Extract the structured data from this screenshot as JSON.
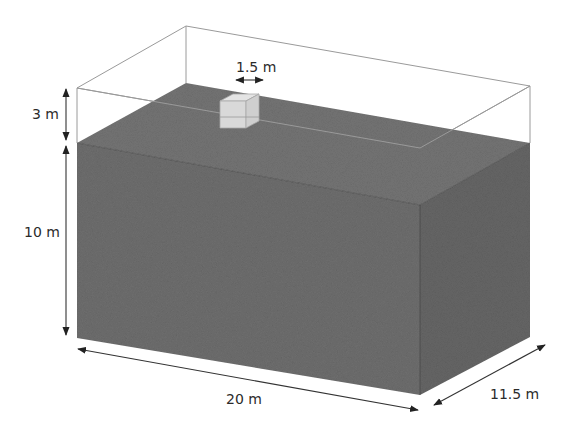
{
  "figure": {
    "colors": {
      "soil": "#6e6e6e",
      "soil_top": "#747474",
      "soil_side": "#666666",
      "block": "#d9d9d9",
      "wire": "#9a9a9a",
      "dimension": "#333333",
      "text": "#2b2b2b"
    },
    "dimensions": {
      "block_width": "1.5 m",
      "air_height": "3 m",
      "soil_depth": "10 m",
      "length": "20 m",
      "width": "11.5 m"
    }
  }
}
